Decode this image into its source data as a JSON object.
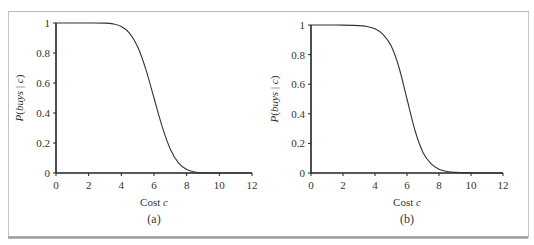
{
  "chart_data": [
    {
      "type": "line",
      "panel_label": "(a)",
      "title": "",
      "xlabel": "Cost c",
      "xlabel_parts": {
        "text": "Cost ",
        "var": "c"
      },
      "ylabel": "P(buys | c)",
      "ylabel_parts": {
        "p": "P(",
        "italic": "buys",
        "mid": " | ",
        "var": "c",
        "end": ")"
      },
      "xlim": [
        0,
        12
      ],
      "ylim": [
        0,
        1
      ],
      "xticks": [
        0,
        2,
        4,
        6,
        8,
        10,
        12
      ],
      "yticks": [
        0,
        0.2,
        0.4,
        0.6,
        0.8,
        1
      ],
      "ytick_labels": [
        "0",
        "0.2",
        "0.4",
        "0.6",
        "0.8",
        "1"
      ],
      "grid": false,
      "series": [
        {
          "name": "P(buys | c)",
          "x": [
            0,
            1,
            2,
            3,
            3.5,
            4,
            4.5,
            5,
            5.5,
            6,
            6.5,
            7,
            7.5,
            8,
            8.5,
            9,
            10,
            11,
            12
          ],
          "values": [
            1.0,
            1.0,
            1.0,
            0.999,
            0.994,
            0.977,
            0.933,
            0.841,
            0.691,
            0.5,
            0.309,
            0.159,
            0.067,
            0.023,
            0.006,
            0.001,
            0.0,
            0.0,
            0.0
          ]
        }
      ],
      "color": "#333333"
    },
    {
      "type": "line",
      "panel_label": "(b)",
      "title": "",
      "xlabel": "Cost c",
      "xlabel_parts": {
        "text": "Cost ",
        "var": "c"
      },
      "ylabel": "P(buys | c)",
      "ylabel_parts": {
        "p": "P(",
        "italic": "buys",
        "mid": " | ",
        "var": "c",
        "end": ")"
      },
      "xlim": [
        0,
        12
      ],
      "ylim": [
        0,
        1
      ],
      "xticks": [
        0,
        2,
        4,
        6,
        8,
        10,
        12
      ],
      "yticks": [
        0,
        0.2,
        0.4,
        0.6,
        0.8,
        1
      ],
      "ytick_labels": [
        "0",
        "0.2",
        "0.4",
        "0.6",
        "0.8",
        "1"
      ],
      "grid": false,
      "series": [
        {
          "name": "P(buys | c)",
          "x": [
            0,
            1,
            2,
            3,
            3.5,
            4,
            4.5,
            5,
            5.5,
            6,
            6.5,
            7,
            7.5,
            8,
            8.5,
            9,
            10,
            11,
            12
          ],
          "values": [
            1.0,
            1.0,
            0.999,
            0.996,
            0.99,
            0.975,
            0.937,
            0.861,
            0.713,
            0.5,
            0.287,
            0.139,
            0.063,
            0.025,
            0.01,
            0.004,
            0.001,
            0.0,
            0.0
          ]
        }
      ],
      "color": "#333333"
    }
  ]
}
